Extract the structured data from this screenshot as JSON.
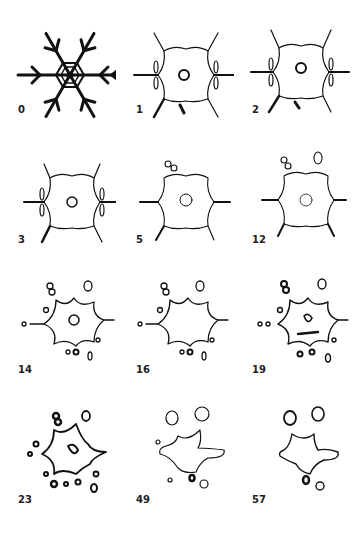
{
  "figure": {
    "panels": [
      {
        "label": "0"
      },
      {
        "label": "1"
      },
      {
        "label": "2"
      },
      {
        "label": "3"
      },
      {
        "label": "5"
      },
      {
        "label": "12"
      },
      {
        "label": "14"
      },
      {
        "label": "16"
      },
      {
        "label": "19"
      },
      {
        "label": "23"
      },
      {
        "label": "49"
      },
      {
        "label": "57"
      }
    ]
  }
}
